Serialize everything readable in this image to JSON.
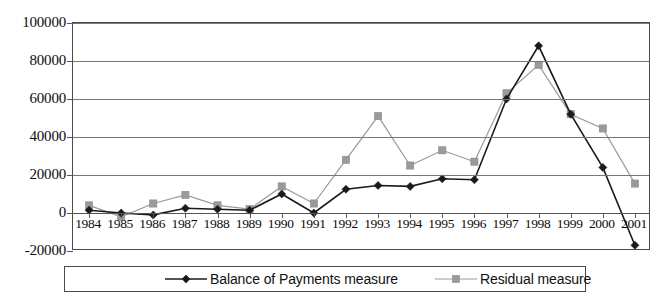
{
  "chart_data": {
    "type": "line",
    "title": "",
    "xlabel": "",
    "ylabel": "",
    "ylim": [
      -20000,
      100000
    ],
    "ytick_values": [
      100000,
      80000,
      60000,
      40000,
      20000,
      0,
      -20000
    ],
    "ytick_labels": [
      "100000",
      "80000",
      "60000",
      "40000",
      "20000",
      "0",
      "-20000"
    ],
    "grid": true,
    "legend_position": "bottom",
    "categories": [
      "1984",
      "1985",
      "1986",
      "1987",
      "1988",
      "1989",
      "1990",
      "1991",
      "1992",
      "1993",
      "1994",
      "1995",
      "1996",
      "1997",
      "1998",
      "1999",
      "2000",
      "2001"
    ],
    "series": [
      {
        "name": "Balance of Payments measure",
        "marker": "diamond",
        "color": "#1a1a1a",
        "values": [
          1500,
          0,
          -1000,
          2500,
          2000,
          1500,
          10000,
          0,
          12500,
          14500,
          14000,
          18000,
          17500,
          60000,
          88000,
          52000,
          24000,
          -17000
        ]
      },
      {
        "name": "Residual measure",
        "marker": "square",
        "color": "#9a9a9a",
        "values": [
          4000,
          -2000,
          5000,
          9500,
          4000,
          2000,
          14000,
          5000,
          28000,
          51000,
          25000,
          33000,
          27000,
          63000,
          78000,
          52000,
          44500,
          15500
        ]
      }
    ]
  },
  "legend": {
    "items": [
      {
        "label": "Balance of Payments measure",
        "marker": "diamond-marker",
        "color": "#1a1a1a"
      },
      {
        "label": "Residual measure",
        "marker": "square-marker",
        "color": "#9a9a9a"
      }
    ]
  }
}
